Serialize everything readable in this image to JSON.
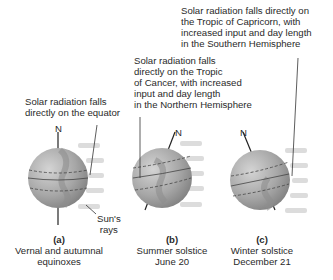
{
  "annotations": {
    "c_top": [
      "Solar radiation falls directly on",
      "the Tropic of Capricorn, with",
      "increased input and day length",
      "in the Southern Hemisphere"
    ],
    "b_top": [
      "Solar radiation falls",
      "directly on the Tropic",
      "of Cancer, with increased",
      "input and day length",
      "in the Northern Hemisphere"
    ],
    "a_top": [
      "Solar radiation falls",
      "directly on the equator"
    ],
    "north_label": "N",
    "rays_label": [
      "Sun's",
      "rays"
    ]
  },
  "panels": [
    {
      "letter": "(a)",
      "line1": "Vernal and autumnal",
      "line2": "equinoxes"
    },
    {
      "letter": "(b)",
      "line1": "Summer solstice",
      "line2": "June 20"
    },
    {
      "letter": "(c)",
      "line1": "Winter solstice",
      "line2": "December 21"
    }
  ],
  "colors": {
    "globe": "#a9a9a9",
    "land": "#8a8a8a",
    "rays": "#d8d8d8",
    "text": "#2a2a2a"
  }
}
